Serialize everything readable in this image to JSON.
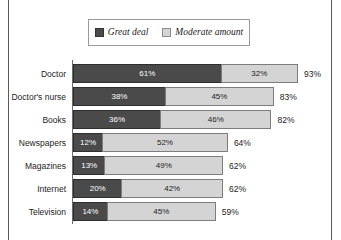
{
  "legend": {
    "entries": [
      {
        "label": "Great deal",
        "swatch": "dark-swatch-icon",
        "color": "#4a4a4a"
      },
      {
        "label": "Moderate amount",
        "swatch": "light-swatch-icon",
        "color": "#d4d4d4"
      }
    ]
  },
  "chart_data": {
    "type": "bar",
    "orientation": "horizontal",
    "stacked": true,
    "title": "",
    "subtitle": "",
    "xlabel": "",
    "ylabel": "",
    "xlim": [
      0,
      100
    ],
    "grid": false,
    "legend_position": "top",
    "categories": [
      "Doctor",
      "Doctor's nurse",
      "Books",
      "Newspapers",
      "Magazines",
      "Internet",
      "Television"
    ],
    "series": [
      {
        "name": "Great deal",
        "color": "#4a4a4a",
        "values": [
          61,
          38,
          36,
          12,
          13,
          20,
          14
        ]
      },
      {
        "name": "Moderate amount",
        "color": "#d4d4d4",
        "values": [
          32,
          45,
          46,
          52,
          49,
          42,
          45
        ]
      }
    ],
    "totals": [
      93,
      83,
      82,
      64,
      62,
      62,
      59
    ],
    "value_labels": {
      "Doctor": {
        "great": "61%",
        "moderate": "32%",
        "total": "93%"
      },
      "Doctor's nurse": {
        "great": "38%",
        "moderate": "45%",
        "total": "83%"
      },
      "Books": {
        "great": "36%",
        "moderate": "46%",
        "total": "82%"
      },
      "Newspapers": {
        "great": "12%",
        "moderate": "52%",
        "total": "64%"
      },
      "Magazines": {
        "great": "13%",
        "moderate": "49%",
        "total": "62%"
      },
      "Internet": {
        "great": "20%",
        "moderate": "42%",
        "total": "62%"
      },
      "Television": {
        "great": "14%",
        "moderate": "45%",
        "total": "59%"
      }
    },
    "rows": [
      {
        "category": "Doctor",
        "great": 61,
        "moderate": 32,
        "total": 93,
        "great_label": "61%",
        "moderate_label": "32%",
        "total_label": "93%"
      },
      {
        "category": "Doctor's nurse",
        "great": 38,
        "moderate": 45,
        "total": 83,
        "great_label": "38%",
        "moderate_label": "45%",
        "total_label": "83%"
      },
      {
        "category": "Books",
        "great": 36,
        "moderate": 46,
        "total": 82,
        "great_label": "36%",
        "moderate_label": "46%",
        "total_label": "82%"
      },
      {
        "category": "Newspapers",
        "great": 12,
        "moderate": 52,
        "total": 64,
        "great_label": "12%",
        "moderate_label": "52%",
        "total_label": "64%"
      },
      {
        "category": "Magazines",
        "great": 13,
        "moderate": 49,
        "total": 62,
        "great_label": "13%",
        "moderate_label": "49%",
        "total_label": "62%"
      },
      {
        "category": "Internet",
        "great": 20,
        "moderate": 42,
        "total": 62,
        "great_label": "20%",
        "moderate_label": "42%",
        "total_label": "62%"
      },
      {
        "category": "Television",
        "great": 14,
        "moderate": 45,
        "total": 59,
        "great_label": "14%",
        "moderate_label": "45%",
        "total_label": "59%"
      }
    ]
  },
  "layout": {
    "plot_left": 73,
    "plot_top": 64,
    "row_height": 19,
    "row_gap": 4,
    "px_per_percent": 2.42,
    "total_label_offset": 6
  }
}
